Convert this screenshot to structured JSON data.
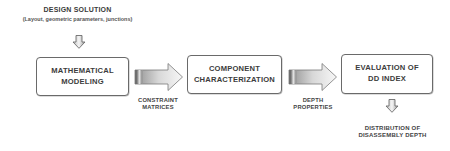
{
  "diagram": {
    "input": {
      "title": "DESIGN SOLUTION",
      "subtitle": "(Layout, geometric parameters, junctions)"
    },
    "nodes": [
      {
        "id": "mathematical-modeling",
        "lines": [
          "MATHEMATICAL",
          "MODELING"
        ]
      },
      {
        "id": "component-characterization",
        "lines": [
          "COMPONENT",
          "CHARACTERIZATION"
        ]
      },
      {
        "id": "evaluation-dd-index",
        "lines": [
          "EVALUATION OF",
          "DD INDEX"
        ]
      }
    ],
    "edges": [
      {
        "from": "mathematical-modeling",
        "to": "component-characterization",
        "lines": [
          "CONSTRAINT",
          "MATRICES"
        ]
      },
      {
        "from": "component-characterization",
        "to": "evaluation-dd-index",
        "lines": [
          "DEPTH",
          "PROPERTIES"
        ]
      }
    ],
    "output": {
      "lines": [
        "DISTRIBUTION OF",
        "DISASSEMBLY DEPTH"
      ]
    },
    "icons": {
      "input_arrow": "down-arrow-icon",
      "flow_arrow": "right-arrow-icon",
      "output_arrow": "down-arrow-icon"
    },
    "colors": {
      "border": "#6a6a6a",
      "text": "#3a3a3a",
      "arrow_dark": "#8a8a8a",
      "arrow_light": "#f2f2f2"
    }
  }
}
